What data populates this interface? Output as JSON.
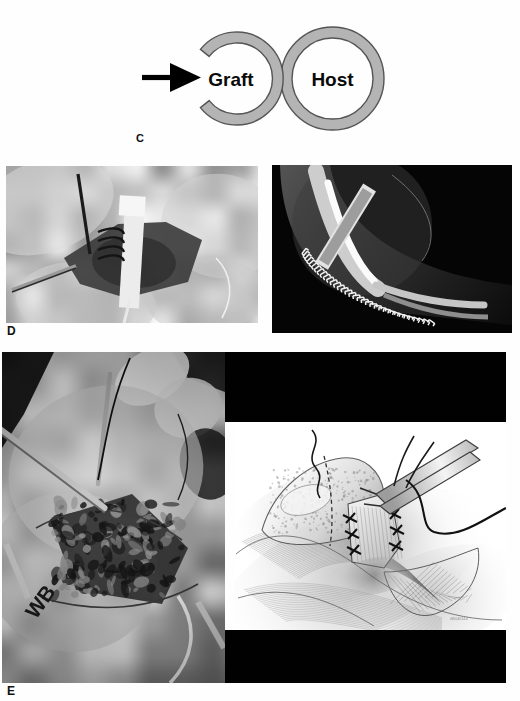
{
  "figure": {
    "background_color": "#fefefe",
    "panels": [
      {
        "id": "C",
        "label": "C",
        "type": "diagram",
        "description": "Schematic of a C-shaped cortical graft apposed to a ring-shaped host bone"
      },
      {
        "id": "D",
        "label": "D",
        "type": "photograph-pair",
        "description": "Intraoperative photograph and lateral radiograph of the reconstructed elbow"
      },
      {
        "id": "E",
        "label": "E",
        "type": "photograph-illustration-pair",
        "description": "Intraoperative photograph and matched pencil medical illustration of the repair"
      }
    ]
  },
  "panel_c": {
    "label": "C",
    "arrow": {
      "name": "direction-arrow",
      "color": "#000000",
      "direction": "right"
    },
    "rings": [
      {
        "name": "graft-ring",
        "label": "Graft",
        "shape": "c-ring",
        "fill": "#b4b4b4",
        "stroke": "#4a4a4a",
        "gap_side": "right"
      },
      {
        "name": "host-ring",
        "label": "Host",
        "shape": "closed-ring",
        "fill": "#b4b4b4",
        "stroke": "#4a4a4a",
        "gap_side": "none"
      }
    ]
  },
  "panel_d": {
    "label": "D",
    "images": [
      {
        "name": "operative-photo-graft-fixation",
        "kind": "photograph",
        "tone": "grayscale",
        "caption_text": ""
      },
      {
        "name": "lateral-radiograph-elbow",
        "kind": "radiograph",
        "tone": "grayscale",
        "caption_text": ""
      }
    ]
  },
  "panel_e": {
    "label": "E",
    "images": [
      {
        "name": "operative-photo-soft-tissue-repair",
        "kind": "photograph",
        "tone": "grayscale",
        "caption_text": ""
      },
      {
        "name": "illustration-tendon-repair",
        "kind": "medical-illustration",
        "tone": "grayscale-pencil",
        "caption_text": ""
      }
    ],
    "artist_credit": "ill/004014-0",
    "black_bars": 2
  }
}
